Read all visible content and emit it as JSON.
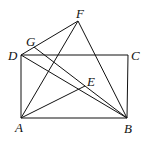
{
  "diagram": {
    "points": {
      "A": [
        21,
        118
      ],
      "B": [
        127,
        118
      ],
      "C": [
        128,
        55
      ],
      "D": [
        21,
        55
      ],
      "E": [
        85,
        86
      ],
      "F": [
        78,
        21
      ],
      "G": [
        34,
        47
      ]
    },
    "segments": [
      [
        "A",
        "B"
      ],
      [
        "B",
        "C"
      ],
      [
        "C",
        "D"
      ],
      [
        "D",
        "A"
      ],
      [
        "D",
        "F"
      ],
      [
        "A",
        "F"
      ],
      [
        "F",
        "B"
      ],
      [
        "D",
        "B"
      ],
      [
        "G",
        "E"
      ],
      [
        "A",
        "E"
      ],
      [
        "E",
        "B"
      ]
    ],
    "labels": {
      "A": "A",
      "B": "B",
      "C": "C",
      "D": "D",
      "E": "E",
      "F": "F",
      "G": "G"
    },
    "stroke_color": "#111111"
  }
}
